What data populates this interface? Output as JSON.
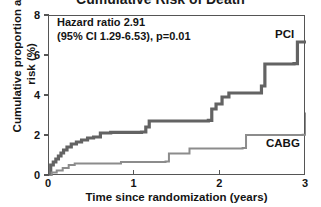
{
  "chart_data": {
    "type": "line",
    "title": "Cumulative Risk of Death",
    "xlabel": "Time since randomization (years)",
    "ylabel": "Cumulative proportion at risk (%)",
    "xlim": [
      0,
      3
    ],
    "ylim": [
      0,
      8
    ],
    "xticks": [
      0,
      1,
      2,
      3
    ],
    "yticks": [
      0,
      2,
      4,
      6,
      8
    ],
    "xtick_labels": [
      "0",
      "1",
      "2",
      "3"
    ],
    "ytick_labels": [
      "0",
      "2",
      "4",
      "6",
      "8"
    ],
    "grid": false,
    "legend_position": "inline-right",
    "step_style": "post",
    "annotations": [
      "Hazard ratio 2.91",
      "(95% CI 1.29-6.53), p=0.01"
    ],
    "series": [
      {
        "name": "PCI",
        "color": "#636363",
        "linewidth": 3.2,
        "x": [
          0.0,
          0.02,
          0.05,
          0.08,
          0.11,
          0.14,
          0.17,
          0.21,
          0.26,
          0.32,
          0.38,
          0.45,
          0.52,
          0.6,
          0.6,
          0.72,
          1.08,
          1.13,
          1.17,
          1.86,
          1.9,
          1.95,
          2.02,
          2.1,
          2.48,
          2.52,
          2.86,
          2.9,
          3.0
        ],
        "y": [
          0.0,
          0.55,
          0.7,
          0.85,
          1.0,
          1.15,
          1.3,
          1.45,
          1.6,
          1.7,
          1.8,
          1.9,
          1.95,
          2.0,
          2.15,
          2.18,
          2.2,
          2.45,
          2.75,
          2.78,
          3.35,
          3.6,
          3.95,
          4.15,
          4.5,
          5.6,
          5.62,
          6.7,
          6.7
        ]
      },
      {
        "name": "CABG",
        "color": "#8c8c8c",
        "linewidth": 2.0,
        "x": [
          0.0,
          0.03,
          0.09,
          0.16,
          0.23,
          0.3,
          0.8,
          0.84,
          1.36,
          1.4,
          1.6,
          1.64,
          2.26,
          2.3,
          2.96,
          3.0
        ],
        "y": [
          0.0,
          0.18,
          0.28,
          0.4,
          0.55,
          0.62,
          0.63,
          0.7,
          0.72,
          1.12,
          1.13,
          1.38,
          1.4,
          2.05,
          2.06,
          3.18
        ]
      }
    ]
  }
}
